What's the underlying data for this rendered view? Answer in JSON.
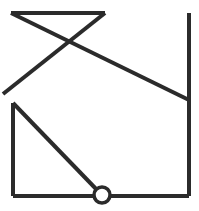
{
  "figure": {
    "type": "line-drawing",
    "canvas": {
      "width": 199,
      "height": 211,
      "background": "#ffffff"
    },
    "stroke_color": "#2b2b2b",
    "stroke_width": 4,
    "node_stroke_width": 3.5,
    "segments": [
      {
        "name": "top-horizontal-segment",
        "label": "top horizontal bar",
        "points": "11,13 105,13",
        "d": "M 11 13 L 105 13"
      },
      {
        "name": "upper-right-to-lower-left-diagonal",
        "label": "diagonal from top-right of bar down-left to left apex",
        "points": "105,13 3,94",
        "d": "M 105 13 L 3 94"
      },
      {
        "name": "upper-left-to-right-long-diagonal",
        "label": "long diagonal from top-left of bar down-right to right vertical",
        "points": "11,13 189,100",
        "d": "M 11 13 L 189 100"
      },
      {
        "name": "right-vertical-segment",
        "label": "right vertical edge",
        "points": "189,13 189,196",
        "d": "M 189 13 L 189 196"
      },
      {
        "name": "bottom-horizontal-segment",
        "label": "bottom horizontal edge",
        "points": "13,196 189,196",
        "d": "M 13 196 L 189 196"
      },
      {
        "name": "left-vertical-segment",
        "label": "left vertical edge of triangle",
        "points": "13,103 13,196",
        "d": "M 13 103 L 13 196"
      },
      {
        "name": "triangle-hypotenuse-segment",
        "label": "hypotenuse from left apex down to node circle",
        "points": "13,103 99,192",
        "d": "M 13 103 L 99 192"
      }
    ],
    "nodes": [
      {
        "name": "node-circle",
        "label": "open circle node on bottom edge",
        "cx": 102,
        "cy": 195,
        "r": 8
      }
    ],
    "intersections": [
      {
        "name": "x-crossing-point",
        "label": "X crossing of the two upper diagonals",
        "x": 72,
        "y": 43
      },
      {
        "name": "left-apex-point",
        "label": "left apex where diagonals converge",
        "x": 3,
        "y": 94
      }
    ]
  }
}
